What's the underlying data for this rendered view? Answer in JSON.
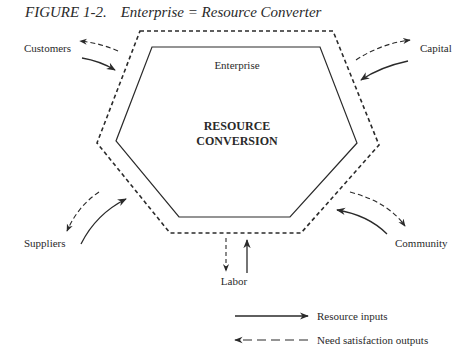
{
  "figure": {
    "number": "FIGURE 1-2.",
    "title": "Enterprise = Resource Converter"
  },
  "diagram": {
    "outer_boundary_label": "Enterprise",
    "core_label_line1": "RESOURCE",
    "core_label_line2": "CONVERSION",
    "stakeholders": {
      "customers": "Customers",
      "capital": "Capital",
      "suppliers": "Suppliers",
      "community": "Community",
      "labor": "Labor"
    }
  },
  "legend": {
    "resource_inputs": "Resource inputs",
    "need_outputs": "Need satisfaction outputs"
  },
  "colors": {
    "ink": "#2a2a2a",
    "background": "#ffffff"
  }
}
